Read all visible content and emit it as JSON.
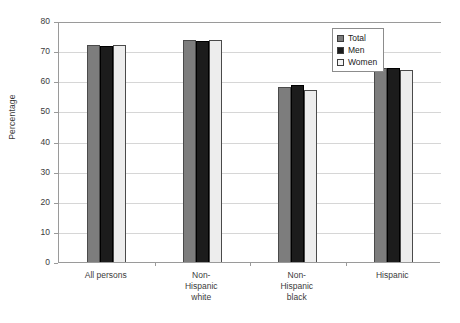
{
  "chart_data": {
    "type": "bar",
    "title": "",
    "xlabel": "",
    "ylabel": "Percentage",
    "ylim": [
      0,
      80
    ],
    "ytick_step": 10,
    "grid": true,
    "legend_position": "top-right",
    "categories": [
      "All persons",
      "Non-Hispanic white",
      "Non-Hispanic black",
      "Hispanic"
    ],
    "series": [
      {
        "name": "Total",
        "color": "#7d7d7d",
        "values": [
          72.0,
          73.6,
          58.1,
          64.3
        ]
      },
      {
        "name": "Men",
        "color": "#1c1c1c",
        "values": [
          71.8,
          73.4,
          58.6,
          64.5
        ]
      },
      {
        "name": "Women",
        "color": "#ededed",
        "values": [
          72.2,
          73.7,
          57.1,
          63.8
        ]
      }
    ],
    "ytick_labels": [
      "80",
      "70",
      "60",
      "50",
      "40",
      "30",
      "20",
      "10",
      "0"
    ],
    "ytick_values": [
      80,
      70,
      60,
      50,
      40,
      30,
      20,
      10,
      0
    ]
  },
  "axis": {
    "y_title": "Percentage",
    "ticks": [
      {
        "label": "80",
        "value": 80
      },
      {
        "label": "70",
        "value": 70
      },
      {
        "label": "60",
        "value": 60
      },
      {
        "label": "50",
        "value": 50
      },
      {
        "label": "40",
        "value": 40
      },
      {
        "label": "30",
        "value": 30
      },
      {
        "label": "20",
        "value": 20
      },
      {
        "label": "10",
        "value": 10
      },
      {
        "label": "0",
        "value": 0
      }
    ]
  },
  "categories": [
    {
      "label": "All persons",
      "lines": [
        "All persons"
      ]
    },
    {
      "label": "Non-Hispanic white",
      "lines": [
        "Non-",
        "Hispanic",
        "white"
      ]
    },
    {
      "label": "Non-Hispanic black",
      "lines": [
        "Non-",
        "Hispanic",
        "black"
      ]
    },
    {
      "label": "Hispanic",
      "lines": [
        "Hispanic"
      ]
    }
  ],
  "legend": {
    "items": [
      {
        "label": "Total",
        "color": "#7d7d7d"
      },
      {
        "label": "Men",
        "color": "#1c1c1c"
      },
      {
        "label": "Women",
        "color": "#f4f4f4"
      }
    ]
  }
}
